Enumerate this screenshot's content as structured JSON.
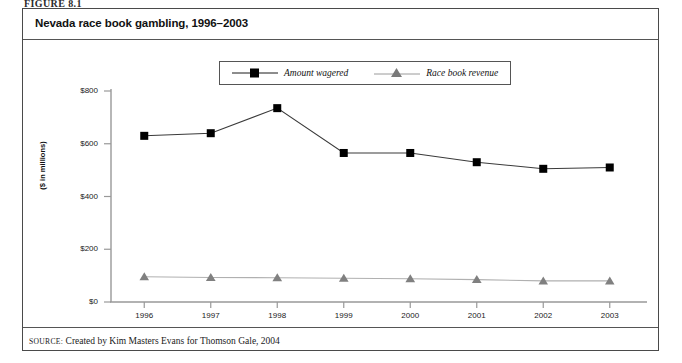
{
  "figure": {
    "label": "FIGURE 8.1",
    "title": "Nevada race book gambling, 1996–2003",
    "source_keyword": "SOURCE:",
    "source_text": "Created by Kim Masters Evans for Thomson Gale, 2004"
  },
  "colors": {
    "series_wagered": "#000000",
    "series_revenue": "#808080",
    "axis": "#999999",
    "frame": "#4a4a4a",
    "text": "#111111"
  },
  "chart_data": {
    "type": "line",
    "title": "Nevada race book gambling, 1996–2003",
    "xlabel": "",
    "ylabel": "($ in millions)",
    "categories": [
      "1996",
      "1997",
      "1998",
      "1999",
      "2000",
      "2001",
      "2002",
      "2003"
    ],
    "series": [
      {
        "name": "Amount wagered",
        "marker": "square",
        "color": "#000000",
        "values": [
          630,
          640,
          735,
          565,
          565,
          530,
          505,
          510
        ]
      },
      {
        "name": "Race book revenue",
        "marker": "triangle",
        "color": "#808080",
        "values": [
          96,
          93,
          92,
          90,
          88,
          85,
          80,
          80
        ]
      }
    ],
    "ylim": [
      0,
      800
    ],
    "yticks": [
      0,
      200,
      400,
      600,
      800
    ],
    "ytick_labels": [
      "$0",
      "$200",
      "$400",
      "$600",
      "$800"
    ],
    "grid": false,
    "legend_position": "top-center"
  }
}
